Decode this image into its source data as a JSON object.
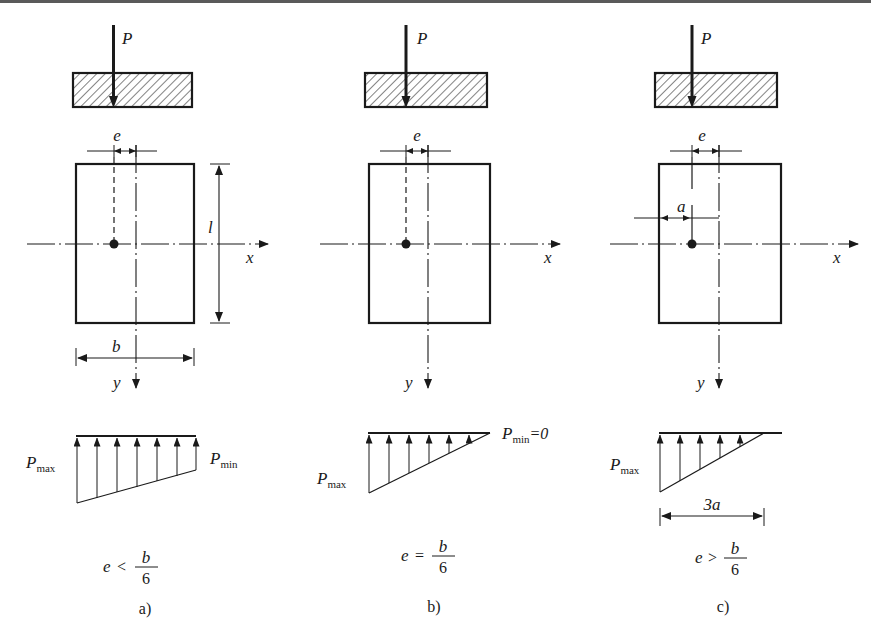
{
  "figure": {
    "panels": [
      {
        "id": "a",
        "caption": "a)",
        "load_label": "P",
        "ecc_label": "e",
        "axis_x_label": "x",
        "axis_y_label": "y",
        "dim_height_label": "l",
        "dim_width_label": "b",
        "pmax_main": "P",
        "pmax_sub": "max",
        "pmin_main": "P",
        "pmin_sub": "min",
        "condition_lhs": "e",
        "condition_op": "<",
        "condition_num": "b",
        "condition_den": "6"
      },
      {
        "id": "b",
        "caption": "b)",
        "load_label": "P",
        "ecc_label": "e",
        "axis_x_label": "x",
        "axis_y_label": "y",
        "pmax_main": "P",
        "pmax_sub": "max",
        "pmin_main": "P",
        "pmin_sub": "min",
        "pmin_value": "=0",
        "condition_lhs": "e",
        "condition_op": "=",
        "condition_num": "b",
        "condition_den": "6"
      },
      {
        "id": "c",
        "caption": "c)",
        "load_label": "P",
        "ecc_label": "e",
        "a_label": "a",
        "axis_x_label": "x",
        "axis_y_label": "y",
        "pmax_main": "P",
        "pmax_sub": "max",
        "contact_length_label": "3a",
        "condition_lhs": "e",
        "condition_op": ">",
        "condition_num": "b",
        "condition_den": "6"
      }
    ],
    "colors": {
      "ink": "#1a1a1a",
      "background": "#ffffff",
      "top_band": "#5a5a5a"
    }
  }
}
